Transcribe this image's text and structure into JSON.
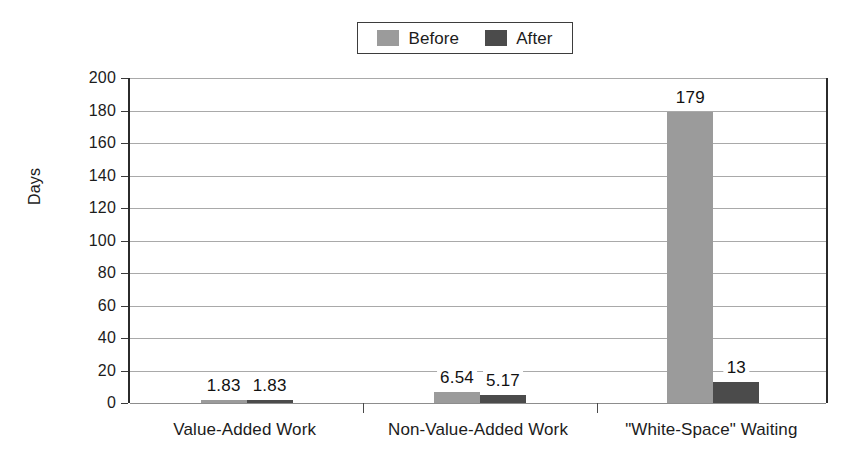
{
  "chart_data": {
    "type": "bar",
    "title": "",
    "xlabel": "",
    "ylabel": "Days",
    "ylim": [
      0,
      200
    ],
    "ytick_step": 20,
    "yticks": [
      200,
      180,
      160,
      140,
      120,
      100,
      80,
      60,
      40,
      20,
      0
    ],
    "ytick_labels": [
      "200",
      "180",
      "160",
      "140",
      "120",
      "100",
      "80",
      "60",
      "40",
      "20",
      "0"
    ],
    "grid": true,
    "legend_position": "top-center",
    "categories": [
      "Value-Added Work",
      "Non-Value-Added Work",
      "\"White-Space\" Waiting"
    ],
    "series": [
      {
        "name": "Before",
        "color": "#9b9b9b",
        "values": [
          1.83,
          6.54,
          179
        ],
        "labels": [
          "1.83",
          "6.54",
          "179"
        ]
      },
      {
        "name": "After",
        "color": "#4b4b4b",
        "values": [
          1.83,
          5.17,
          13
        ],
        "labels": [
          "1.83",
          "5.17",
          "13"
        ]
      }
    ]
  },
  "legend": {
    "entries": [
      {
        "label": "Before",
        "color": "#9b9b9b"
      },
      {
        "label": "After",
        "color": "#4b4b4b"
      }
    ]
  },
  "axes": {
    "y_title": "Days"
  }
}
